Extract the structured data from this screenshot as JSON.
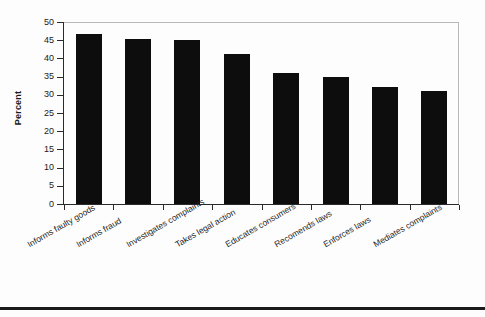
{
  "chart_data": {
    "type": "bar",
    "title": "",
    "subtitle": "",
    "xlabel": "",
    "ylabel": "Percent",
    "ylim": [
      0,
      50
    ],
    "ytick_step": 5,
    "yticks": [
      0,
      5,
      10,
      15,
      20,
      25,
      30,
      35,
      40,
      45,
      50
    ],
    "grid": false,
    "legend": false,
    "legend_position": "none",
    "bar_color": "#0d0d0d",
    "axis_color": "#2a2a2a",
    "frame_color": "#b9b9b9",
    "xtick_label_rotation_deg": -30,
    "categories": [
      "Informs faulty goods",
      "Informs fraud",
      "Investigates complaints",
      "Takes legal action",
      "Educates consumers",
      "Recomends laws",
      "Enforces laws",
      "Mediates complaints"
    ],
    "values": [
      47.0,
      45.6,
      45.4,
      41.6,
      36.3,
      35.1,
      32.3,
      31.3
    ],
    "series": [
      {
        "name": "Percent",
        "values": [
          47.0,
          45.6,
          45.4,
          41.6,
          36.3,
          35.1,
          32.3,
          31.3
        ]
      }
    ]
  }
}
